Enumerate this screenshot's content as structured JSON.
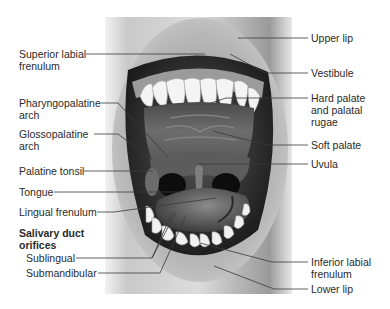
{
  "figure": {
    "labels_left": [
      {
        "id": "superior-labial-frenulum",
        "text": "Superior labial\nfrenulum"
      },
      {
        "id": "pharyngopalatine-arch",
        "text": "Pharyngopalatine\narch"
      },
      {
        "id": "glossopalatine-arch",
        "text": "Glossopalatine\narch"
      },
      {
        "id": "palatine-tonsil",
        "text": "Palatine tonsil"
      },
      {
        "id": "tongue",
        "text": "Tongue"
      },
      {
        "id": "lingual-frenulum",
        "text": "Lingual frenulum"
      },
      {
        "id": "salivary-duct-orifices",
        "text": "Salivary duct\norifices"
      },
      {
        "id": "sublingual",
        "text": "Sublingual"
      },
      {
        "id": "submandibular",
        "text": "Submandibular"
      }
    ],
    "labels_right": [
      {
        "id": "upper-lip",
        "text": "Upper lip"
      },
      {
        "id": "vestibule",
        "text": "Vestibule"
      },
      {
        "id": "hard-palate",
        "text": "Hard palate\nand palatal\nrugae"
      },
      {
        "id": "soft-palate",
        "text": "Soft palate"
      },
      {
        "id": "uvula",
        "text": "Uvula"
      },
      {
        "id": "inferior-labial-frenulum",
        "text": "Inferior labial\nfrenulum"
      },
      {
        "id": "lower-lip",
        "text": "Lower lip"
      }
    ]
  },
  "colors": {
    "background": "#ffffff",
    "label_text": "#2a2a2a",
    "leader_line": "#3a3a3a"
  }
}
